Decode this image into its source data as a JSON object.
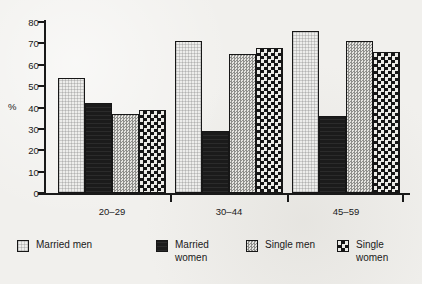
{
  "chart_data": {
    "type": "bar",
    "title": "",
    "xlabel": "",
    "ylabel": "%",
    "ylim": [
      0,
      80
    ],
    "yticks": [
      0,
      10,
      20,
      30,
      40,
      50,
      60,
      70,
      80
    ],
    "grid": false,
    "legend_position": "bottom",
    "categories": [
      "20–29",
      "30–44",
      "45–59"
    ],
    "series": [
      {
        "name": "Married men",
        "values": [
          54,
          71,
          76
        ]
      },
      {
        "name": "Married women",
        "values": [
          42,
          29,
          36
        ]
      },
      {
        "name": "Single men",
        "values": [
          37,
          65,
          71
        ]
      },
      {
        "name": "Single women",
        "values": [
          39,
          68,
          66
        ]
      }
    ]
  },
  "axis": {
    "unit_label": "%",
    "tick_labels": [
      "0",
      "10",
      "20",
      "30",
      "40",
      "50",
      "60",
      "70",
      "80"
    ]
  },
  "legend": {
    "items": [
      {
        "label": "Married men",
        "swatch": "light-stipple-swatch"
      },
      {
        "label": "Married women",
        "swatch": "solid-dark-swatch"
      },
      {
        "label": "Single men",
        "swatch": "gray-dotted-swatch"
      },
      {
        "label": "Single women",
        "swatch": "checkerboard-swatch"
      }
    ]
  }
}
